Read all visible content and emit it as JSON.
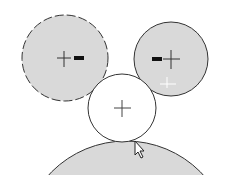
{
  "canvas": {
    "width": 225,
    "height": 184,
    "background": "#ffffff"
  },
  "colors": {
    "fill": "#d9d9d9",
    "stroke": "#333333",
    "white": "#ffffff",
    "marker": "#111111"
  },
  "circles": [
    {
      "id": "left",
      "cx": 65,
      "cy": 58,
      "r": 43,
      "filled": true,
      "dashed": true,
      "center_marker": "cross",
      "side_marker": "dash-right"
    },
    {
      "id": "right",
      "cx": 171,
      "cy": 59,
      "r": 37,
      "filled": true,
      "dashed": false,
      "center_marker": "cross",
      "side_marker": "dash-left"
    },
    {
      "id": "middle",
      "cx": 122,
      "cy": 108,
      "r": 34,
      "filled": false,
      "dashed": false,
      "center_marker": "cross"
    },
    {
      "id": "bottom",
      "cx": 126,
      "cy": 246,
      "r": 105,
      "filled": true,
      "dashed": false,
      "clipped_at_y": 175
    }
  ],
  "cursor": {
    "type": "arrow-pointer",
    "x": 135,
    "y": 141
  }
}
